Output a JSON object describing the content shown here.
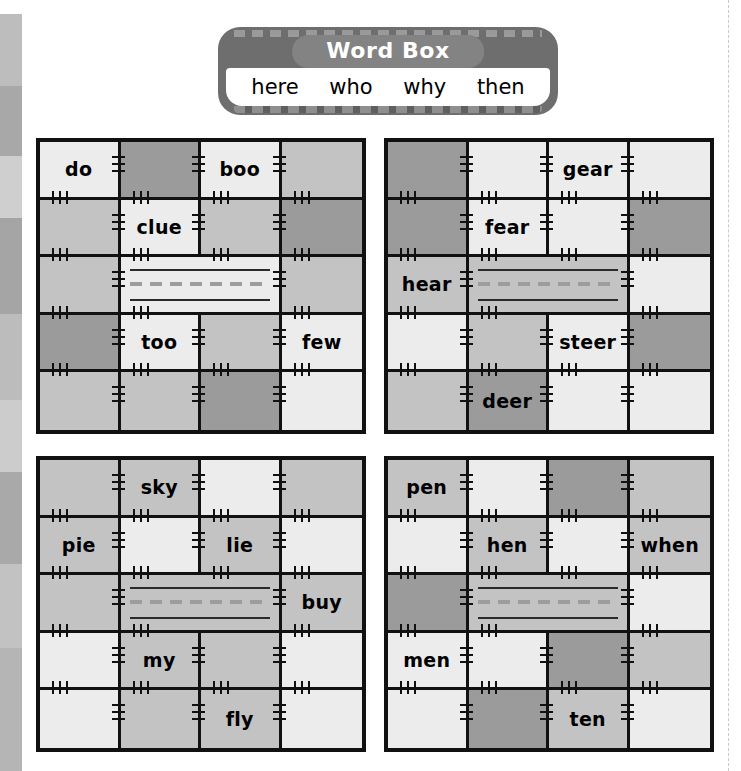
{
  "page": {
    "background": "#ffffff",
    "trim_guide_color": "#c9c9c9"
  },
  "edge_stripes": [
    {
      "color": "#ffffff",
      "height": 14
    },
    {
      "color": "#bdbdbd",
      "height": 72
    },
    {
      "color": "#a8a8a8",
      "height": 70
    },
    {
      "color": "#cfcfcf",
      "height": 62
    },
    {
      "color": "#a5a5a5",
      "height": 96
    },
    {
      "color": "#bcbcbc",
      "height": 86
    },
    {
      "color": "#cccccc",
      "height": 72
    },
    {
      "color": "#a9a9a9",
      "height": 92
    },
    {
      "color": "#c2c2c2",
      "height": 84
    },
    {
      "color": "#b5b5b5",
      "height": 123
    }
  ],
  "word_box": {
    "title": "Word Box",
    "words": [
      "here",
      "who",
      "why",
      "then"
    ],
    "banner_color": "#6e6e6e",
    "pill_color": "#838383",
    "word_strip_color": "#ffffff",
    "title_color": "#ffffff"
  },
  "palette": {
    "light": "#ececec",
    "mid": "#c3c3c3",
    "dark": "#9b9b9b",
    "seam": "#111111",
    "rule": "#2a2a2a",
    "rule_dashed": "#9d9d9d"
  },
  "quilts": [
    {
      "name": "quilt-oo-sound",
      "words": [
        "do",
        "boo",
        "clue",
        "too",
        "few"
      ],
      "rows": [
        [
          {
            "tone": "light",
            "word": "do"
          },
          {
            "tone": "dark",
            "word": ""
          },
          {
            "tone": "light",
            "word": "boo"
          },
          {
            "tone": "mid",
            "word": ""
          }
        ],
        [
          {
            "tone": "mid",
            "word": ""
          },
          {
            "tone": "light",
            "word": "clue"
          },
          {
            "tone": "mid",
            "word": ""
          },
          {
            "tone": "dark",
            "word": ""
          }
        ],
        [
          {
            "tone": "mid",
            "word": ""
          },
          {
            "tone": "light",
            "word": "",
            "writing": true
          },
          {
            "tone": "mid",
            "word": ""
          }
        ],
        [
          {
            "tone": "dark",
            "word": ""
          },
          {
            "tone": "light",
            "word": "too"
          },
          {
            "tone": "mid",
            "word": ""
          },
          {
            "tone": "light",
            "word": "few"
          }
        ],
        [
          {
            "tone": "mid",
            "word": ""
          },
          {
            "tone": "mid",
            "word": ""
          },
          {
            "tone": "dark",
            "word": ""
          },
          {
            "tone": "light",
            "word": ""
          }
        ]
      ]
    },
    {
      "name": "quilt-ear-sound",
      "words": [
        "gear",
        "fear",
        "hear",
        "steer",
        "deer"
      ],
      "rows": [
        [
          {
            "tone": "dark",
            "word": ""
          },
          {
            "tone": "light",
            "word": ""
          },
          {
            "tone": "light",
            "word": "gear"
          },
          {
            "tone": "light",
            "word": ""
          }
        ],
        [
          {
            "tone": "dark",
            "word": ""
          },
          {
            "tone": "light",
            "word": "fear"
          },
          {
            "tone": "light",
            "word": ""
          },
          {
            "tone": "dark",
            "word": ""
          }
        ],
        [
          {
            "tone": "mid",
            "word": "hear"
          },
          {
            "tone": "mid",
            "word": "",
            "writing": true
          },
          {
            "tone": "light",
            "word": ""
          }
        ],
        [
          {
            "tone": "light",
            "word": ""
          },
          {
            "tone": "mid",
            "word": ""
          },
          {
            "tone": "light",
            "word": "steer"
          },
          {
            "tone": "dark",
            "word": ""
          }
        ],
        [
          {
            "tone": "mid",
            "word": ""
          },
          {
            "tone": "dark",
            "word": "deer"
          },
          {
            "tone": "light",
            "word": ""
          },
          {
            "tone": "light",
            "word": ""
          }
        ]
      ]
    },
    {
      "name": "quilt-long-i-sound",
      "words": [
        "sky",
        "pie",
        "lie",
        "buy",
        "my",
        "fly"
      ],
      "rows": [
        [
          {
            "tone": "mid",
            "word": ""
          },
          {
            "tone": "mid",
            "word": "sky"
          },
          {
            "tone": "light",
            "word": ""
          },
          {
            "tone": "mid",
            "word": ""
          }
        ],
        [
          {
            "tone": "mid",
            "word": "pie"
          },
          {
            "tone": "light",
            "word": ""
          },
          {
            "tone": "mid",
            "word": "lie"
          },
          {
            "tone": "light",
            "word": ""
          }
        ],
        [
          {
            "tone": "mid",
            "word": ""
          },
          {
            "tone": "mid",
            "word": "",
            "writing": true
          },
          {
            "tone": "mid",
            "word": "buy"
          }
        ],
        [
          {
            "tone": "light",
            "word": ""
          },
          {
            "tone": "mid",
            "word": "my"
          },
          {
            "tone": "mid",
            "word": ""
          },
          {
            "tone": "light",
            "word": ""
          }
        ],
        [
          {
            "tone": "light",
            "word": ""
          },
          {
            "tone": "mid",
            "word": ""
          },
          {
            "tone": "mid",
            "word": "fly"
          },
          {
            "tone": "light",
            "word": ""
          }
        ]
      ]
    },
    {
      "name": "quilt-en-sound",
      "words": [
        "pen",
        "hen",
        "when",
        "men",
        "ten"
      ],
      "rows": [
        [
          {
            "tone": "mid",
            "word": "pen"
          },
          {
            "tone": "light",
            "word": ""
          },
          {
            "tone": "dark",
            "word": ""
          },
          {
            "tone": "mid",
            "word": ""
          }
        ],
        [
          {
            "tone": "light",
            "word": ""
          },
          {
            "tone": "mid",
            "word": "hen"
          },
          {
            "tone": "light",
            "word": ""
          },
          {
            "tone": "mid",
            "word": "when"
          }
        ],
        [
          {
            "tone": "dark",
            "word": ""
          },
          {
            "tone": "mid",
            "word": "",
            "writing": true
          },
          {
            "tone": "light",
            "word": ""
          }
        ],
        [
          {
            "tone": "light",
            "word": "men"
          },
          {
            "tone": "light",
            "word": ""
          },
          {
            "tone": "dark",
            "word": ""
          },
          {
            "tone": "mid",
            "word": ""
          }
        ],
        [
          {
            "tone": "light",
            "word": ""
          },
          {
            "tone": "dark",
            "word": ""
          },
          {
            "tone": "mid",
            "word": "ten"
          },
          {
            "tone": "light",
            "word": ""
          }
        ]
      ]
    }
  ]
}
